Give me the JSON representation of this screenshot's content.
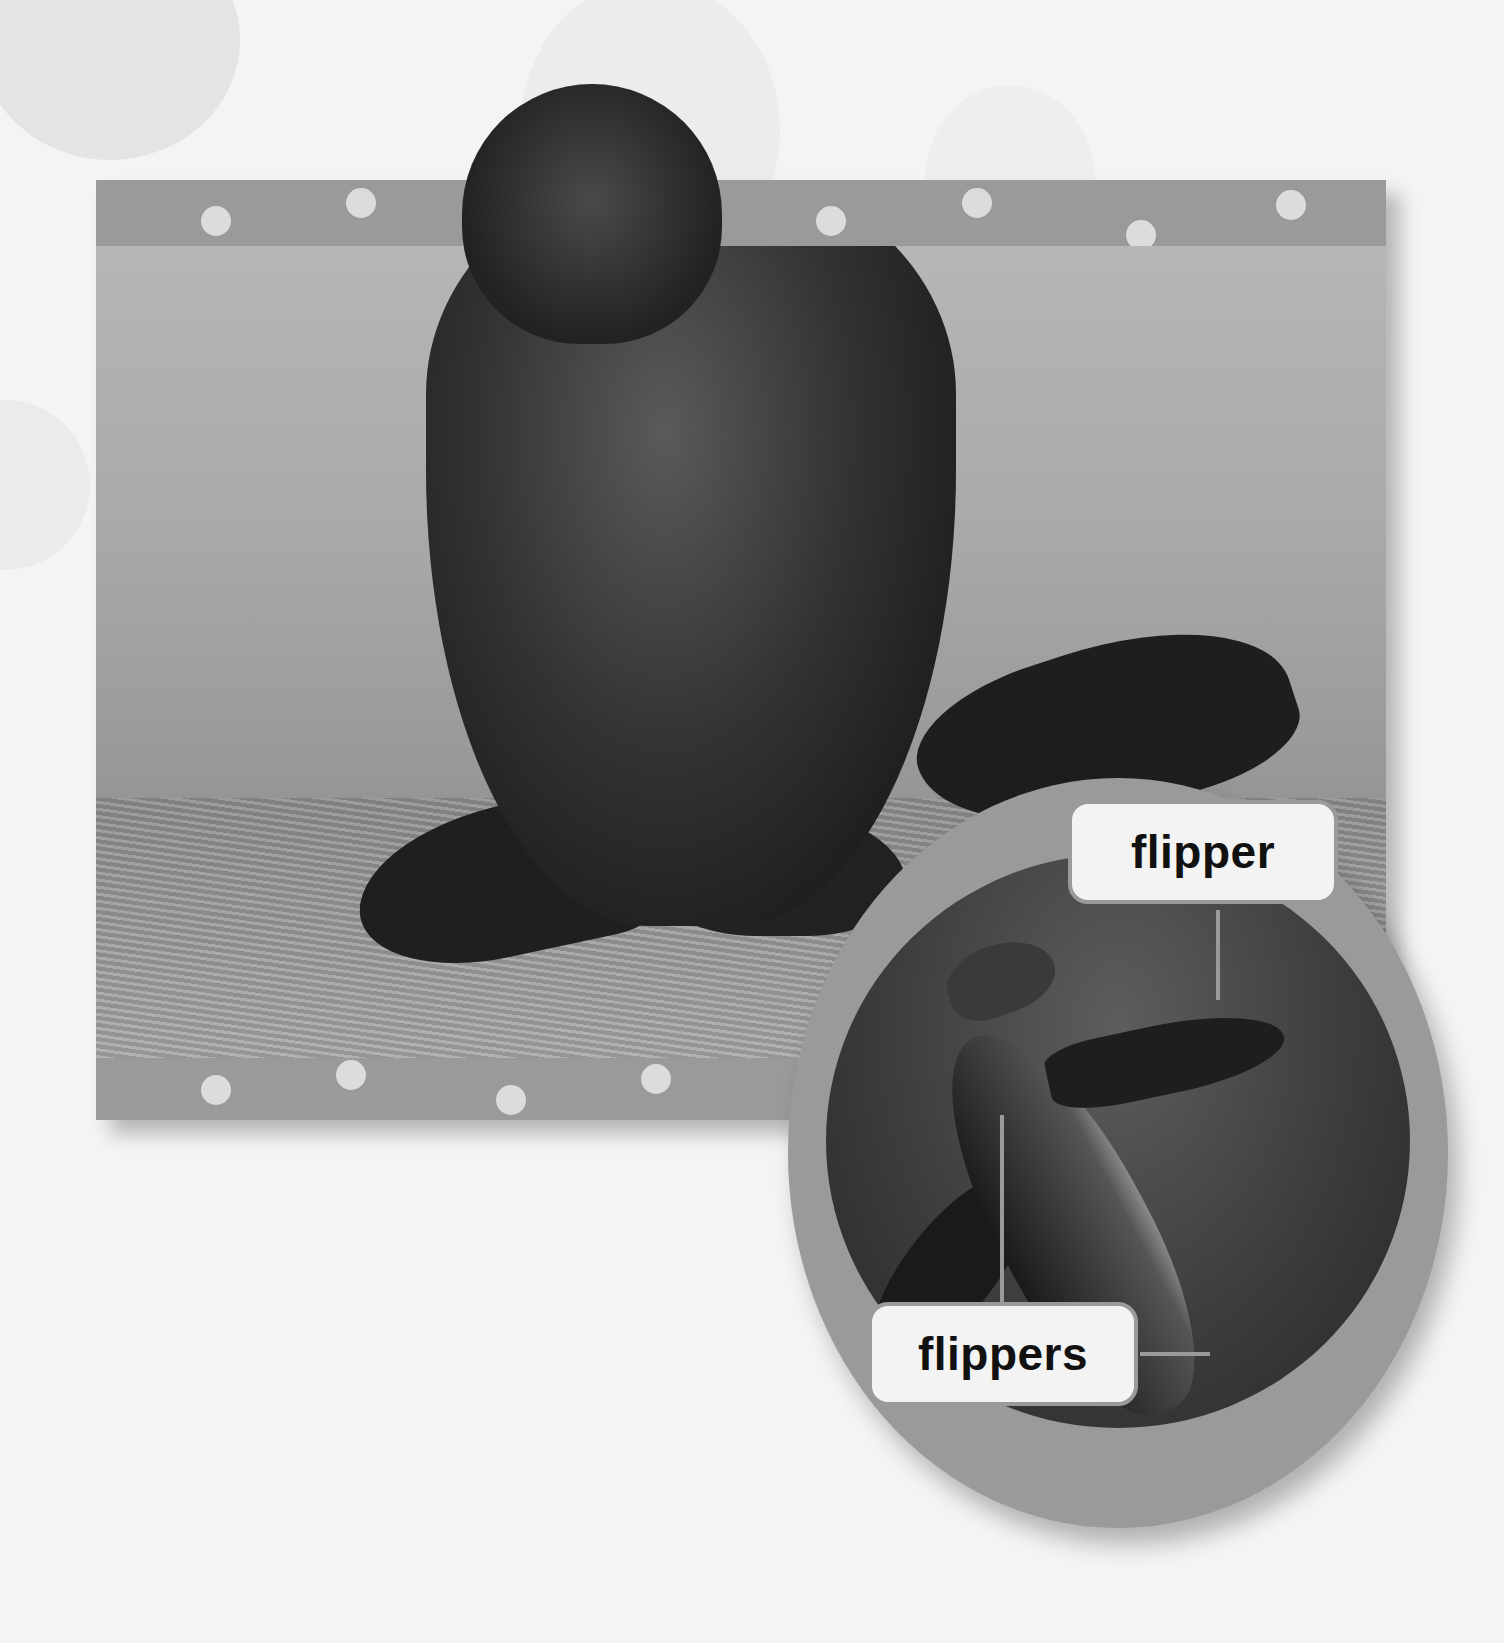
{
  "scene": {
    "description": "Textbook illustration: fur seal walking on sand in a dotted gray frame, with an oval inset of a sea lion swimming underwater",
    "colors": {
      "background": "#f4f4f4",
      "frame": "#9a9a9a",
      "frame_dots": "#dcdcdc",
      "label_fill": "#f3f3f3",
      "label_text": "#111111"
    }
  },
  "main_photo": {
    "subject": "fur seal on sand",
    "top_dots": 7,
    "bottom_dots": 4
  },
  "inset": {
    "subject": "sea lion swimming underwater",
    "labels": [
      {
        "text": "flipper"
      },
      {
        "text": "flippers"
      }
    ]
  }
}
